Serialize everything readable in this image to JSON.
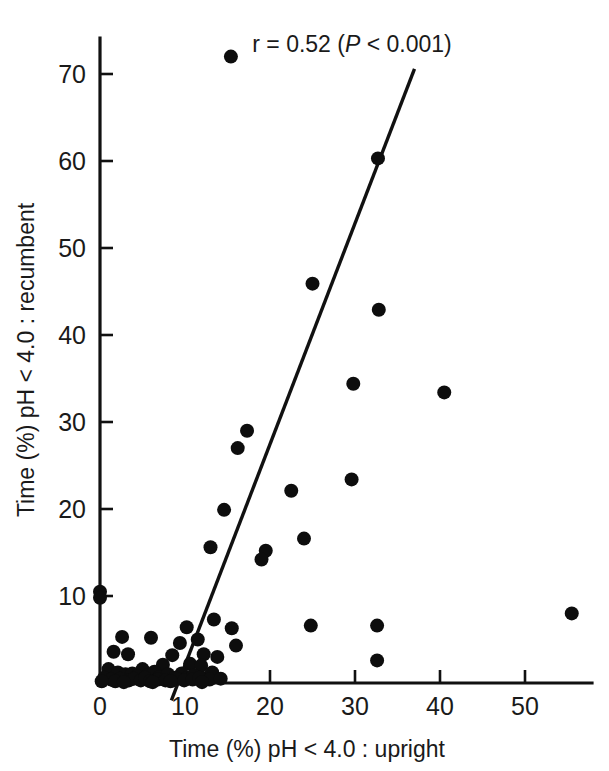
{
  "chart_data": {
    "type": "scatter",
    "title": "",
    "xlabel": "Time (%) pH < 4.0 : upright",
    "ylabel": "Time (%) pH < 4.0 : recumbent",
    "xlim": [
      0,
      58
    ],
    "ylim": [
      0,
      76
    ],
    "xticks": [
      0,
      10,
      20,
      30,
      40,
      50
    ],
    "yticks": [
      10,
      20,
      30,
      40,
      50,
      60,
      70
    ],
    "xtick_labels": [
      "0",
      "10",
      "20",
      "30",
      "40",
      "50"
    ],
    "ytick_labels": [
      "10",
      "20",
      "30",
      "40",
      "50",
      "60",
      "70"
    ],
    "grid": false,
    "legend": null,
    "annotations": [
      {
        "name": "correlation-annotation",
        "text_prefix": "r = 0.52 (",
        "text_italic": "P",
        "text_suffix": " < 0.001)",
        "full_text": "r = 0.52 (P < 0.001)",
        "r": 0.52,
        "p": "< 0.001",
        "x": 29,
        "y": 74
      }
    ],
    "fit_line": {
      "name": "regression-line",
      "x_start": 8.4,
      "y_start": -2.0,
      "x_end": 37.0,
      "y_end": 70.6
    },
    "marker": {
      "shape": "circle",
      "color": "#0d0d0d",
      "radius_px": 7
    },
    "points": [
      [
        15.4,
        72.0
      ],
      [
        32.7,
        60.3
      ],
      [
        25.0,
        45.9
      ],
      [
        32.8,
        42.9
      ],
      [
        29.8,
        34.4
      ],
      [
        40.5,
        33.4
      ],
      [
        17.3,
        29.0
      ],
      [
        29.6,
        23.4
      ],
      [
        16.2,
        27.0
      ],
      [
        22.5,
        22.1
      ],
      [
        14.6,
        19.9
      ],
      [
        24.0,
        16.6
      ],
      [
        13.0,
        15.6
      ],
      [
        19.5,
        15.2
      ],
      [
        19.0,
        14.2
      ],
      [
        0.0,
        10.5
      ],
      [
        0.0,
        9.8
      ],
      [
        55.5,
        8.0
      ],
      [
        24.8,
        6.6
      ],
      [
        32.6,
        6.6
      ],
      [
        13.4,
        7.3
      ],
      [
        15.5,
        6.3
      ],
      [
        10.2,
        6.4
      ],
      [
        2.6,
        5.3
      ],
      [
        6.0,
        5.2
      ],
      [
        11.5,
        5.0
      ],
      [
        9.4,
        4.6
      ],
      [
        16.0,
        4.3
      ],
      [
        32.6,
        2.6
      ],
      [
        1.6,
        3.6
      ],
      [
        3.3,
        3.3
      ],
      [
        8.5,
        3.2
      ],
      [
        12.2,
        3.3
      ],
      [
        13.8,
        3.0
      ],
      [
        10.6,
        2.2
      ],
      [
        11.9,
        2.0
      ],
      [
        7.4,
        2.1
      ],
      [
        5.0,
        1.6
      ],
      [
        1.0,
        1.6
      ],
      [
        2.1,
        1.2
      ],
      [
        3.0,
        1.0
      ],
      [
        3.8,
        1.1
      ],
      [
        4.4,
        0.8
      ],
      [
        5.6,
        0.9
      ],
      [
        6.4,
        1.3
      ],
      [
        7.0,
        0.7
      ],
      [
        8.0,
        1.0
      ],
      [
        8.8,
        0.6
      ],
      [
        9.6,
        1.1
      ],
      [
        10.0,
        0.5
      ],
      [
        11.0,
        0.9
      ],
      [
        12.6,
        0.6
      ],
      [
        13.2,
        1.2
      ],
      [
        0.5,
        0.6
      ],
      [
        1.3,
        0.4
      ],
      [
        2.4,
        0.5
      ],
      [
        3.4,
        0.3
      ],
      [
        4.0,
        0.5
      ],
      [
        4.8,
        0.3
      ],
      [
        5.3,
        0.6
      ],
      [
        6.8,
        0.4
      ],
      [
        7.7,
        0.3
      ],
      [
        9.0,
        0.5
      ],
      [
        9.9,
        0.3
      ],
      [
        10.9,
        0.4
      ],
      [
        11.7,
        0.6
      ],
      [
        12.9,
        0.4
      ],
      [
        14.2,
        0.5
      ],
      [
        0.2,
        0.2
      ],
      [
        1.8,
        0.2
      ],
      [
        2.8,
        0.1
      ],
      [
        5.9,
        0.2
      ],
      [
        6.2,
        0.1
      ],
      [
        8.3,
        0.2
      ],
      [
        12.0,
        0.1
      ]
    ]
  }
}
